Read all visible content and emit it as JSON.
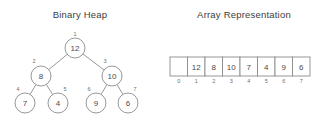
{
  "figure": {
    "heap_panel": {
      "title": "Binary Heap"
    },
    "array_panel": {
      "title": "Array Representation"
    },
    "colors": {
      "stroke": "#8c8c8c",
      "text": "#4a4a4a",
      "index_text": "#6e6e6e",
      "background": "#ffffff"
    }
  },
  "chart_data": {
    "type": "diagram",
    "heap": {
      "title": "Binary Heap",
      "root_index": 1,
      "nodes": [
        {
          "index": "1",
          "value": "12",
          "cx": 75,
          "cy": 48,
          "r": 10,
          "level": 0
        },
        {
          "index": "2",
          "value": "8",
          "cx": 41,
          "cy": 76,
          "r": 10,
          "level": 1
        },
        {
          "index": "3",
          "value": "10",
          "cx": 112,
          "cy": 76,
          "r": 10,
          "level": 1
        },
        {
          "index": "4",
          "value": "7",
          "cx": 25,
          "cy": 103,
          "r": 10,
          "level": 2
        },
        {
          "index": "5",
          "value": "4",
          "cx": 58,
          "cy": 103,
          "r": 10,
          "level": 2
        },
        {
          "index": "6",
          "value": "9",
          "cx": 96,
          "cy": 103,
          "r": 10,
          "level": 2
        },
        {
          "index": "7",
          "value": "6",
          "cx": 128,
          "cy": 103,
          "r": 10,
          "level": 2
        }
      ],
      "edges": [
        {
          "from": "1",
          "to": "2"
        },
        {
          "from": "1",
          "to": "3"
        },
        {
          "from": "2",
          "to": "4"
        },
        {
          "from": "2",
          "to": "5"
        },
        {
          "from": "3",
          "to": "6"
        },
        {
          "from": "3",
          "to": "7"
        }
      ]
    },
    "array": {
      "title": "Array Representation",
      "x0": 170,
      "y0": 57,
      "cell_width": 17.5,
      "cell_height": 19,
      "cells": [
        {
          "index": "0",
          "value": ""
        },
        {
          "index": "1",
          "value": "12"
        },
        {
          "index": "2",
          "value": "8"
        },
        {
          "index": "3",
          "value": "10"
        },
        {
          "index": "4",
          "value": "7"
        },
        {
          "index": "5",
          "value": "4"
        },
        {
          "index": "6",
          "value": "9"
        },
        {
          "index": "7",
          "value": "6"
        }
      ]
    }
  }
}
